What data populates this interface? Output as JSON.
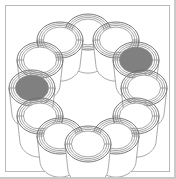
{
  "figure": {
    "background_color": "#ffffff",
    "frame_color": "#b9b9b9",
    "edge_shadow_color": "#c9c9c9",
    "outline_color": "#6e6e6e",
    "rim_color": "#8a8a8a",
    "body_color": "#9a9a9a",
    "fill_color": "#808080",
    "empty_color": "#ffffff",
    "cup_count": 12,
    "filled_count": 2,
    "empty_count": 10,
    "ring_center_x": 88,
    "ring_center_y": 88,
    "ring_radius": 56,
    "cup_rim_radius_x": 23,
    "cup_rim_radius_y": 18,
    "cup_body_height": 34,
    "rim_ring_count": 4
  },
  "cups": [
    {
      "id": "cup-01",
      "index": 0,
      "angle_deg": 270,
      "position": "top-center",
      "state": "empty",
      "fill": "#ffffff",
      "cx": 88,
      "cy": 32
    },
    {
      "id": "cup-02",
      "index": 1,
      "angle_deg": 300,
      "position": "top-right",
      "state": "empty",
      "fill": "#ffffff",
      "cx": 116,
      "cy": 40
    },
    {
      "id": "cup-03",
      "index": 2,
      "angle_deg": 330,
      "position": "upper-right",
      "state": "filled",
      "fill": "#808080",
      "cx": 136,
      "cy": 60
    },
    {
      "id": "cup-04",
      "index": 3,
      "angle_deg": 0,
      "position": "right-center",
      "state": "empty",
      "fill": "#ffffff",
      "cx": 144,
      "cy": 88
    },
    {
      "id": "cup-05",
      "index": 4,
      "angle_deg": 30,
      "position": "lower-right",
      "state": "empty",
      "fill": "#ffffff",
      "cx": 136,
      "cy": 116
    },
    {
      "id": "cup-06",
      "index": 5,
      "angle_deg": 60,
      "position": "bottom-right",
      "state": "empty",
      "fill": "#ffffff",
      "cx": 116,
      "cy": 136
    },
    {
      "id": "cup-07",
      "index": 6,
      "angle_deg": 90,
      "position": "bottom-center",
      "state": "empty",
      "fill": "#ffffff",
      "cx": 88,
      "cy": 144
    },
    {
      "id": "cup-08",
      "index": 7,
      "angle_deg": 120,
      "position": "bottom-left",
      "state": "empty",
      "fill": "#ffffff",
      "cx": 60,
      "cy": 136
    },
    {
      "id": "cup-09",
      "index": 8,
      "angle_deg": 150,
      "position": "lower-left",
      "state": "empty",
      "fill": "#ffffff",
      "cx": 40,
      "cy": 116
    },
    {
      "id": "cup-10",
      "index": 9,
      "angle_deg": 180,
      "position": "left-center",
      "state": "filled",
      "fill": "#808080",
      "cx": 32,
      "cy": 88
    },
    {
      "id": "cup-11",
      "index": 10,
      "angle_deg": 210,
      "position": "upper-left",
      "state": "empty",
      "fill": "#ffffff",
      "cx": 40,
      "cy": 60
    },
    {
      "id": "cup-12",
      "index": 11,
      "angle_deg": 240,
      "position": "top-left",
      "state": "empty",
      "fill": "#ffffff",
      "cx": 60,
      "cy": 40
    }
  ],
  "draw_order": [
    0,
    11,
    1,
    10,
    2,
    9,
    3,
    8,
    4,
    7,
    5,
    6
  ]
}
